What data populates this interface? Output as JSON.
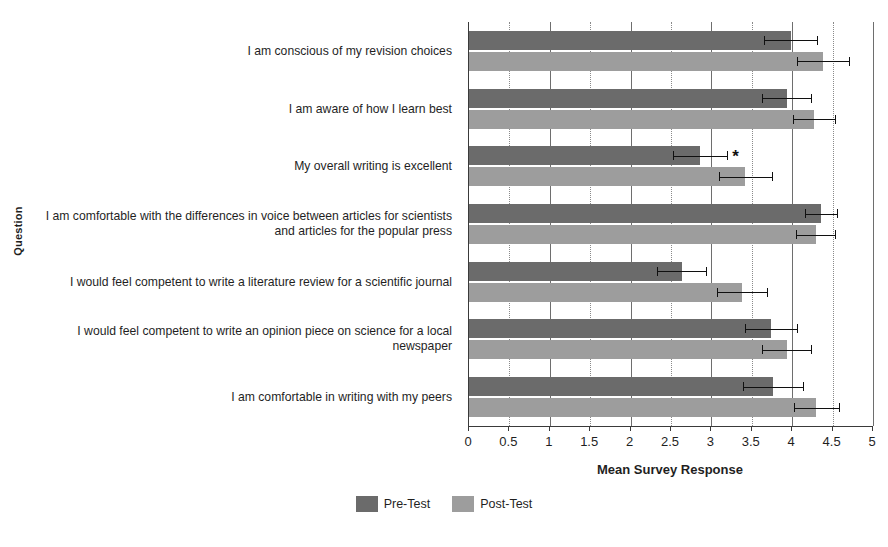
{
  "chart_data": {
    "type": "bar",
    "orientation": "horizontal",
    "title": "",
    "xlabel": "Mean Survey Response",
    "ylabel": "Question",
    "xlim": [
      0,
      5
    ],
    "ylim": [
      0,
      7
    ],
    "grid": true,
    "legend_position": "bottom",
    "xticks": [
      0,
      0.5,
      1,
      1.5,
      2,
      2.5,
      3,
      3.5,
      4,
      4.5,
      5
    ],
    "xticklabels": [
      "0",
      "0.5",
      "1",
      "1.5",
      "2",
      "2.5",
      "3",
      "3.5",
      "4",
      "4.5",
      "5"
    ],
    "categories": [
      "I am conscious of my revision choices",
      "I am aware of how I learn best",
      "My overall writing is excellent",
      "I am comfortable with the differences in voice between articles for scientists and articles for the popular press",
      "I would feel competent to write a literature review for a scientific journal",
      "I would feel competent to write an opinion piece on science for a local newspaper",
      "I am comfortable in writing with my peers"
    ],
    "series": [
      {
        "name": "Pre-Test",
        "color": "#6b6b6b",
        "values": [
          3.98,
          3.93,
          2.86,
          4.36,
          2.63,
          3.74,
          3.76
        ],
        "errors": [
          0.33,
          0.3,
          0.33,
          0.2,
          0.3,
          0.32,
          0.37
        ]
      },
      {
        "name": "Post-Test",
        "color": "#9d9d9d",
        "values": [
          4.38,
          4.27,
          3.42,
          4.29,
          3.38,
          3.93,
          4.3
        ],
        "errors": [
          0.32,
          0.26,
          0.33,
          0.24,
          0.31,
          0.3,
          0.28
        ]
      }
    ],
    "annotations": [
      {
        "text": "*",
        "category_index": 2,
        "x": 3.3,
        "note": "significance marker on 'My overall writing is excellent'"
      }
    ]
  },
  "legend": {
    "entries": [
      {
        "label": "Pre-Test",
        "color": "#6b6b6b"
      },
      {
        "label": "Post-Test",
        "color": "#9d9d9d"
      }
    ]
  },
  "axes": {
    "x_title": "Mean Survey Response",
    "y_title": "Question"
  }
}
